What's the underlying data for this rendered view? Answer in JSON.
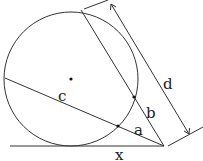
{
  "diagram": {
    "type": "geometry",
    "labels": {
      "c": "c",
      "a": "a",
      "b": "b",
      "d": "d",
      "x": "x"
    },
    "colors": {
      "stroke": "#333333",
      "text": "#222222",
      "background": "#ffffff"
    }
  }
}
